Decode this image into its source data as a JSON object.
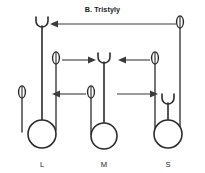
{
  "figure": {
    "title": "B. Tristyly",
    "panel_letter": "B",
    "panel_name": "Tristyly",
    "background_color": "#ffffff",
    "ink_color": "#2b2b2b",
    "arrow_color": "#3a3a3a"
  },
  "morphs": [
    {
      "id": "L",
      "label": "L",
      "label_x": 42,
      "label_y": 167,
      "ovary": {
        "cx": 42,
        "cy": 134,
        "r": 14
      },
      "style": {
        "x": 42,
        "top": 22,
        "bottom": 134,
        "level": "long"
      },
      "stigma": {
        "cx": 42,
        "cy": 22,
        "level": "long"
      },
      "anthers": [
        {
          "cx": 56,
          "cy": 58,
          "level": "mid",
          "filament_bottom": 130
        },
        {
          "cx": 22,
          "cy": 92,
          "level": "short",
          "filament_bottom": 132
        }
      ]
    },
    {
      "id": "M",
      "label": "M",
      "label_x": 104,
      "label_y": 167,
      "ovary": {
        "cx": 104,
        "cy": 136,
        "r": 13
      },
      "style": {
        "x": 104,
        "top": 58,
        "bottom": 136,
        "level": "mid"
      },
      "stigma": {
        "cx": 104,
        "cy": 58,
        "level": "mid"
      },
      "anthers": [
        {
          "cx": 91,
          "cy": 92,
          "level": "short",
          "filament_bottom": 134
        }
      ]
    },
    {
      "id": "S",
      "label": "S",
      "label_x": 168,
      "label_y": 167,
      "ovary": {
        "cx": 168,
        "cy": 134,
        "r": 14
      },
      "style": {
        "x": 168,
        "top": 99,
        "bottom": 134,
        "level": "short"
      },
      "stigma": {
        "cx": 168,
        "cy": 99,
        "level": "short"
      },
      "anthers": [
        {
          "cx": 180,
          "cy": 22,
          "level": "long",
          "filament_bottom": 130
        },
        {
          "cx": 155,
          "cy": 58,
          "level": "mid",
          "filament_bottom": 130
        }
      ]
    }
  ],
  "pollen_flows": [
    {
      "id": "long-anther-to-long-stigma",
      "from": "S long anther",
      "to": "L long stigma",
      "level": "long",
      "direction": "left",
      "y": 24,
      "x_start": 176,
      "x_end": 50
    },
    {
      "id": "mid-anther-L-to-mid-stigma-M",
      "from": "L mid anther",
      "to": "M mid stigma",
      "level": "mid",
      "direction": "right",
      "y": 60,
      "x_start": 62,
      "x_end": 96
    },
    {
      "id": "mid-anther-S-to-mid-stigma-M",
      "from": "S mid anther",
      "to": "M mid stigma",
      "level": "mid",
      "direction": "left",
      "y": 60,
      "x_start": 150,
      "x_end": 118
    },
    {
      "id": "short-anther-M-to-short-stigma-L",
      "from": "M short anther",
      "to": "L short organs",
      "level": "short",
      "direction": "left",
      "y": 94,
      "x_start": 86,
      "x_end": 52
    },
    {
      "id": "short-anther-L-to-short-stigma-S",
      "from": "L short region",
      "to": "S short stigma",
      "level": "short",
      "direction": "right",
      "y": 94,
      "x_start": 117,
      "x_end": 158
    }
  ]
}
